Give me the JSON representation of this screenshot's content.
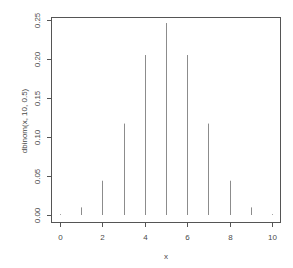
{
  "chart_data": {
    "type": "bar",
    "subtype": "histogram-lines (type='h')",
    "title": "",
    "xlabel": "x",
    "ylabel": "dbinom(x, 10, 0.5)",
    "x": [
      0,
      1,
      2,
      3,
      4,
      5,
      6,
      7,
      8,
      9,
      10
    ],
    "values": [
      0.000977,
      0.009766,
      0.043945,
      0.117188,
      0.205078,
      0.246094,
      0.205078,
      0.117188,
      0.043945,
      0.009766,
      0.000977
    ],
    "xlim": [
      -0.4,
      10.4
    ],
    "ylim": [
      0,
      0.25
    ],
    "x_ticks": [
      0,
      2,
      4,
      6,
      8,
      10
    ],
    "x_tick_labels": [
      "0",
      "2",
      "4",
      "6",
      "8",
      "10"
    ],
    "y_ticks": [
      0,
      0.05,
      0.1,
      0.15,
      0.2,
      0.25
    ],
    "y_tick_labels": [
      "0.00",
      "0.05",
      "0.10",
      "0.15",
      "0.20",
      "0.25"
    ],
    "grid": false,
    "legend": null,
    "colors": {
      "bars": "#8c8c8c",
      "frame": "#555555",
      "text": "#4a4a4a"
    }
  }
}
